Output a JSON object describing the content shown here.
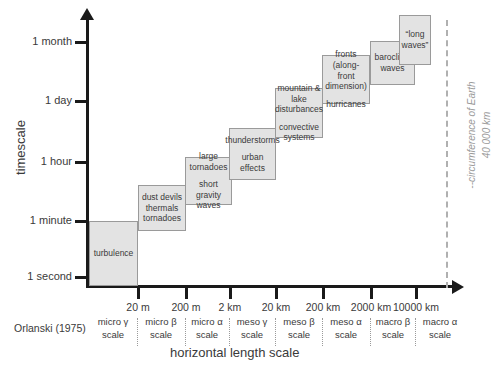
{
  "axes": {
    "y_title": "timescale",
    "x_title": "horizontal length scale",
    "y_ticks": [
      {
        "label": "1 month",
        "y": 42
      },
      {
        "label": "1 day",
        "y": 101
      },
      {
        "label": "1 hour",
        "y": 162
      },
      {
        "label": "1 minute",
        "y": 221
      },
      {
        "label": "1 second",
        "y": 277
      }
    ],
    "x_ticks": [
      {
        "label": "20 m",
        "x": 137
      },
      {
        "label": "200 m",
        "x": 185
      },
      {
        "label": "2 km",
        "x": 229
      },
      {
        "label": "20 km",
        "x": 275
      },
      {
        "label": "200 km",
        "x": 322
      },
      {
        "label": "2000 km",
        "x": 370
      },
      {
        "label": "10000 km",
        "x": 415
      }
    ]
  },
  "orlanski": {
    "credit": "Orlanski (1975)",
    "cells": [
      {
        "label": "micro γ\nscale",
        "x": 113
      },
      {
        "label": "micro β\nscale",
        "x": 161
      },
      {
        "label": "micro α\nscale",
        "x": 207
      },
      {
        "label": "meso γ\nscale",
        "x": 252
      },
      {
        "label": "meso β\nscale",
        "x": 299
      },
      {
        "label": "meso α\nscale",
        "x": 346
      },
      {
        "label": "macro β\nscale",
        "x": 393
      },
      {
        "label": "macro α\nscale",
        "x": 440
      }
    ],
    "dividers": [
      137,
      185,
      229,
      275,
      322,
      370,
      415
    ]
  },
  "earth": {
    "label": "--circumference of Earth\n40 000 km",
    "line_x": 446
  },
  "boxes": [
    {
      "name": "turbulence",
      "groups": [
        "turbulence"
      ],
      "x": 89,
      "y": 221,
      "w": 49,
      "h": 65
    },
    {
      "name": "dust-devils",
      "groups": [
        "dust devils\nthermals\ntornadoes"
      ],
      "x": 138,
      "y": 185,
      "w": 48,
      "h": 46
    },
    {
      "name": "large-tornadoes",
      "groups": [
        "large\ntornadoes",
        "short\ngravity waves"
      ],
      "x": 185,
      "y": 157,
      "w": 47,
      "h": 48
    },
    {
      "name": "thunderstorms",
      "groups": [
        "thunderstorms",
        "urban effects"
      ],
      "x": 229,
      "y": 128,
      "w": 47,
      "h": 52
    },
    {
      "name": "mountain-lake",
      "groups": [
        "mountain &\nlake\ndisturbances",
        "convective\nsystems"
      ],
      "x": 275,
      "y": 88,
      "w": 48,
      "h": 50
    },
    {
      "name": "fronts",
      "groups": [
        "fronts (along-\nfront\ndimension)",
        "hurricanes"
      ],
      "x": 322,
      "y": 55,
      "w": 48,
      "h": 49
    },
    {
      "name": "baroclinic-waves",
      "groups": [
        "baroclinic\nwaves"
      ],
      "x": 370,
      "y": 41,
      "w": 45,
      "h": 44
    },
    {
      "name": "long-waves",
      "groups": [
        "“long\nwaves”"
      ],
      "x": 399,
      "y": 15,
      "w": 32,
      "h": 50
    }
  ],
  "colors": {
    "box_fill": "#e3e3e3",
    "box_border": "#9a9a9a",
    "axis": "#1a1a1a",
    "text": "#3a3a3a",
    "earth_dash": "#b0b0b0"
  }
}
